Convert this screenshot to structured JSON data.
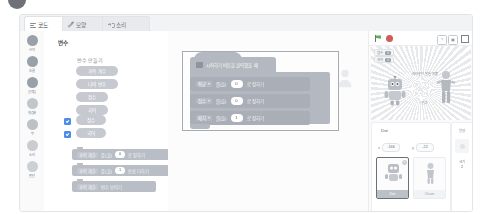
{
  "app": {
    "name": "Entry Block Editor"
  },
  "tabs": [
    {
      "label": "코드",
      "icon": "code-bars-icon",
      "active": true
    },
    {
      "label": "모양",
      "icon": "brush-icon",
      "active": false
    },
    {
      "label": "소리",
      "icon": "speaker-icon",
      "active": false
    }
  ],
  "categories": [
    {
      "label": "시작",
      "color": "#9aa0a7"
    },
    {
      "label": "흐름",
      "color": "#9aa0a7"
    },
    {
      "label": "움직임",
      "color": "#9aa0a7"
    },
    {
      "label": "생김새",
      "color": "#c2c6cb"
    },
    {
      "label": "붓",
      "color": "#bcc1c6"
    },
    {
      "label": "소리",
      "color": "#c9cdd2"
    },
    {
      "label": "판단",
      "color": "#ccd0d4"
    }
  ],
  "palette": {
    "title": "변수",
    "create_button": "변수 만들기",
    "chips": [
      {
        "label": "과목 개수"
      },
      {
        "label": "나의 변수"
      },
      {
        "label": "점수"
      },
      {
        "label": "국어"
      }
    ],
    "checkboxes": [
      {
        "label": "점수",
        "checked": true
      },
      {
        "label": "국어",
        "checked": true
      }
    ],
    "blocks": [
      {
        "var": "과목 개수",
        "mid": "를(을)",
        "value": "0",
        "tail": "로 정하기"
      },
      {
        "var": "과목 개수",
        "mid": "를(을)",
        "value": "1",
        "tail": "만큼 더하기"
      },
      {
        "var": "과목 개수",
        "mid": "",
        "value": "",
        "tail": "변수 보이기"
      }
    ]
  },
  "workspace": {
    "hat_block": "시작하기 버튼을 클릭했을 때",
    "rows": [
      {
        "var": "평균",
        "mid": "를(을)",
        "value": "0",
        "tail": "로 정하기"
      },
      {
        "var": "점수",
        "mid": "를(을)",
        "value": "0",
        "tail": "로 정하기"
      },
      {
        "var": "배치",
        "mid": "를(을)",
        "value": "1",
        "tail": "로 정하기"
      }
    ]
  },
  "stage": {
    "controls": {
      "start": "시작하기",
      "stop": "정지하기",
      "help": "?",
      "capture": "저장",
      "fullscreen": "전체화면"
    },
    "monitors": [
      {
        "name": "점수",
        "value": "0"
      },
      {
        "name": "국어",
        "value": "0"
      }
    ],
    "caption": "여러분이\n만든 작품",
    "subcaption": "안녕!"
  },
  "object_panel": {
    "name": "Dot",
    "x_label": "x",
    "x_value": "-166",
    "y_label": "y",
    "y_value": "-22",
    "objects": [
      {
        "name": "Dot",
        "selected": true
      },
      {
        "name": "Cham",
        "selected": false
      }
    ]
  },
  "properties": [
    {
      "label": "방향",
      "value": ""
    },
    {
      "label": "크기",
      "value": "2"
    }
  ]
}
